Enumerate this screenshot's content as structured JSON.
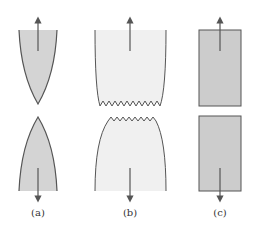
{
  "figure": {
    "panels": [
      {
        "id": "a",
        "label": "(a)",
        "description": "cup-and-cone style pointed fracture"
      },
      {
        "id": "b",
        "label": "(b)",
        "description": "moderately ductile fracture with jagged surface"
      },
      {
        "id": "c",
        "label": "(c)",
        "description": "brittle fracture, flat surfaces"
      }
    ],
    "colors": {
      "fill_dark": "#d4d4d4",
      "fill_light": "#f0f0f0",
      "fill_medium": "#cccccc",
      "outline": "#555555",
      "arrow": "#555555"
    }
  }
}
